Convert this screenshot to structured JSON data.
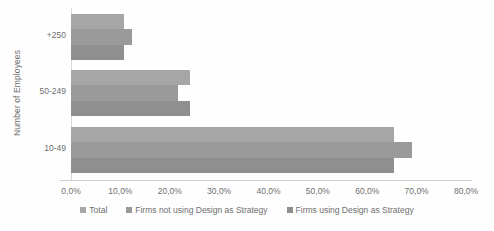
{
  "chart_data": {
    "type": "bar",
    "orientation": "horizontal",
    "title": "",
    "xlabel": "",
    "ylabel": "Number of Employees",
    "categories": [
      "+250",
      "50-249",
      "10-49"
    ],
    "series": [
      {
        "name": "Total",
        "values": [
          10.7,
          24.0,
          65.5
        ],
        "color": "#a6a6a6"
      },
      {
        "name": "Firms not using Design as Strategy",
        "values": [
          12.3,
          21.7,
          69.0
        ],
        "color": "#9a9a9a"
      },
      {
        "name": "Firms using Design as Strategy",
        "values": [
          10.7,
          24.0,
          65.5
        ],
        "color": "#8f8f8f"
      }
    ],
    "xlim": [
      0,
      80
    ],
    "xtick_labels": [
      "0,0%",
      "10,0%",
      "20,0%",
      "30,0%",
      "40,0%",
      "50,0%",
      "60,0%",
      "70,0%",
      "80,0%"
    ],
    "xtick_values": [
      0,
      10,
      20,
      30,
      40,
      50,
      60,
      70,
      80
    ],
    "grid": false,
    "legend_position": "bottom"
  },
  "colors": {
    "background": "#fefefe",
    "axis": "#d9d9d9",
    "text": "#6e6e6e",
    "series_total": "#a6a6a6",
    "series_not_using": "#9a9a9a",
    "series_using": "#8f8f8f"
  }
}
